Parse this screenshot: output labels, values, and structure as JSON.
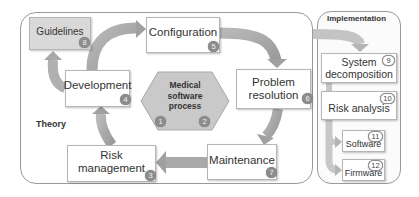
{
  "diagram": {
    "sections": {
      "theory": {
        "label": "Theory"
      },
      "implementation": {
        "label": "Implementation"
      }
    },
    "center": {
      "label_lines": [
        "Medical",
        "software",
        "process"
      ],
      "badges": [
        "1",
        "2"
      ]
    },
    "nodes": {
      "guidelines": {
        "label": "Guidelines",
        "number": "8"
      },
      "configuration": {
        "label": "Configuration",
        "number": "5"
      },
      "development": {
        "label": "Development",
        "number": "4"
      },
      "problem_resolution": {
        "label_lines": [
          "Problem",
          "resolution"
        ],
        "number": "6"
      },
      "risk_management": {
        "label": "Risk management",
        "number": "3"
      },
      "maintenance": {
        "label": "Maintenance",
        "number": "7"
      },
      "system_decomposition": {
        "label_lines": [
          "System",
          "decomposition"
        ],
        "number": "9"
      },
      "risk_analysis": {
        "label": "Risk analysis",
        "number": "10"
      },
      "software": {
        "label": "Software",
        "number": "11"
      },
      "firmware": {
        "label": "Firmware",
        "number": "12"
      }
    },
    "flow": [
      "Development -> Configuration",
      "Configuration -> Problem resolution",
      "Problem resolution -> Maintenance",
      "Maintenance -> Risk management",
      "Risk management -> Development",
      "Development -> Guidelines",
      "Theory -> System decomposition",
      "Risk analysis -> Software",
      "Risk analysis -> Firmware"
    ],
    "colors": {
      "arrow": "#a6a6a6",
      "arrow_light": "#c8c8c8",
      "hexagon": "#c9c9c9",
      "badge": "#8c8c8c",
      "guidelines_fill": "#d9d9d9",
      "border": "#9a9a9a"
    }
  }
}
